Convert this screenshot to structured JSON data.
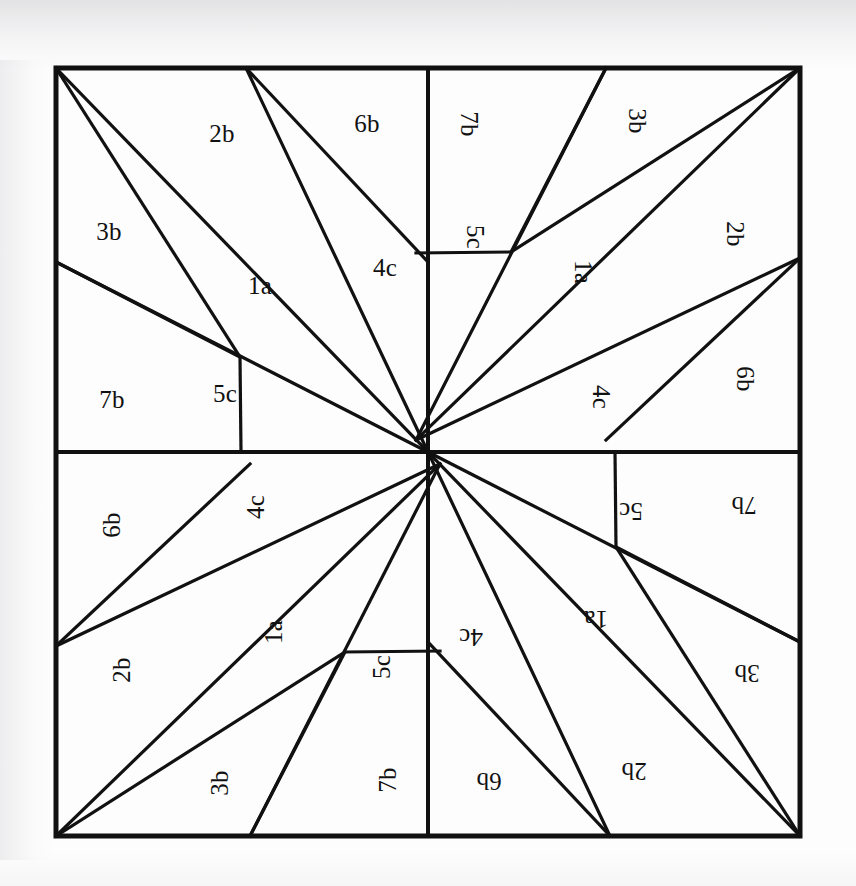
{
  "diagram": {
    "type": "quilt-block-pattern",
    "symmetry": "4-fold rotational (90 degree)",
    "colors": {
      "line": "#111111",
      "background": "#ffffff",
      "paper": "#fdfdfd"
    },
    "outer_square": {
      "left": 56,
      "top": 68,
      "right": 800,
      "bottom": 836,
      "border_width": 5
    },
    "center_point": {
      "x": 428,
      "y": 452
    },
    "piece_labels": [
      "1a",
      "2b",
      "3b",
      "4c",
      "5c",
      "6b",
      "7b"
    ],
    "quadrants": [
      {
        "name": "top-left",
        "rotation": 0,
        "origin_x": 56,
        "origin_y": 68
      },
      {
        "name": "top-right",
        "rotation": 90,
        "origin_x": 800,
        "origin_y": 68
      },
      {
        "name": "bottom-right",
        "rotation": 180,
        "origin_x": 800,
        "origin_y": 836
      },
      {
        "name": "bottom-left",
        "rotation": 270,
        "origin_x": 56,
        "origin_y": 836
      }
    ],
    "quadrant_pieces": [
      {
        "id": "1a",
        "label": "1a",
        "lx": 204,
        "ly": 217
      },
      {
        "id": "2b",
        "label": "2b",
        "lx": 166,
        "ly": 65
      },
      {
        "id": "3b",
        "label": "3b",
        "lx": 53,
        "ly": 163
      },
      {
        "id": "4c",
        "label": "4c",
        "lx": 329,
        "ly": 199
      },
      {
        "id": "5c",
        "label": "5c",
        "lx": 169,
        "ly": 325
      },
      {
        "id": "6b",
        "label": "6b",
        "lx": 311,
        "ly": 55
      },
      {
        "id": "7b",
        "label": "7b",
        "lx": 56,
        "ly": 331
      }
    ],
    "quadrant_geometry": {
      "width": 372,
      "height": 384,
      "vertices": {
        "corner": {
          "x": 0,
          "y": 0
        },
        "top_edge": {
          "x": 190,
          "y": 0
        },
        "left_edge": {
          "x": 0,
          "y": 194
        },
        "interior": {
          "x": 184,
          "y": 289
        },
        "bottom_mid": {
          "x": 185,
          "y": 384
        },
        "center": {
          "x": 372,
          "y": 384
        },
        "right_mid": {
          "x": 372,
          "y": 194
        }
      },
      "segments": [
        {
          "from": "corner",
          "to": "center"
        },
        {
          "from": "corner",
          "to": "interior"
        },
        {
          "from": "top_edge",
          "to": "center"
        },
        {
          "from": "top_edge",
          "to": "right_mid"
        },
        {
          "from": "left_edge",
          "to": "center"
        },
        {
          "from": "left_edge",
          "to": "interior"
        },
        {
          "from": "interior",
          "to": "bottom_mid"
        }
      ]
    }
  }
}
